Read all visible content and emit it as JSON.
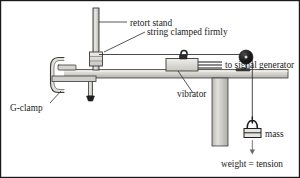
{
  "figure": {
    "border_color": "#1a1a1a",
    "background": "#ffffff"
  },
  "labels": {
    "retort_stand": "retort stand",
    "string_clamped": "string clamped firmly",
    "signal_generator": "to signal generator",
    "vibrator": "vibrator",
    "g_clamp": "G-clamp",
    "mass": "mass",
    "weight_tension": "weight = tension"
  },
  "colors": {
    "line": "#2b2b2b",
    "metal_light": "#dedcd8",
    "metal_mid": "#c3c1bc",
    "metal_dark": "#9a9894",
    "pulley": "#1c1c1c",
    "text": "#1a1a1a",
    "bench_top": "#d2d0cb",
    "bench_leg": "#bcbab5"
  },
  "parts": {
    "retort_stand": {
      "name": "retort stand rod",
      "x": 96,
      "y_top": 28,
      "y_bottom": 70
    },
    "string_clamp_block": {
      "name": "string clamp block",
      "x": 92,
      "y": 56
    },
    "vibrator": {
      "name": "vibrator box",
      "x": 168,
      "y": 62
    },
    "vibrator_peg": {
      "name": "vibrator peg",
      "x": 190,
      "y": 56
    },
    "signal_leads": {
      "name": "signal generator leads",
      "x": 207,
      "y": 64
    },
    "bench_top": {
      "name": "bench top",
      "x": 52,
      "y": 70,
      "w": 236,
      "h": 9
    },
    "bench_leg": {
      "name": "bench leg",
      "x": 212,
      "y": 79,
      "w": 16,
      "h": 67
    },
    "g_clamp": {
      "name": "G-clamp",
      "x": 56,
      "y": 58
    },
    "pulley": {
      "name": "pulley wheel",
      "cx": 246,
      "cy": 57,
      "r": 6.5
    },
    "string": {
      "name": "string",
      "from_x": 100,
      "to_x": 246,
      "y": 55
    },
    "hanging_string": {
      "name": "hanging string",
      "x": 250,
      "y_top": 60,
      "y_bottom": 118
    },
    "mass_hanger": {
      "name": "mass hanger",
      "x": 250,
      "y": 122
    },
    "weight_arrow": {
      "name": "weight arrow",
      "x": 250,
      "y_top": 136,
      "y_bottom": 152
    }
  },
  "leaders": {
    "retort_stand": {
      "from_x": 100,
      "from_y": 22,
      "to_x": 128,
      "to_y": 22
    },
    "string_clamped": {
      "from_x": 106,
      "from_y": 52,
      "to_x": 145,
      "to_y": 32
    },
    "vibrator": {
      "from_x": 178,
      "from_y": 72,
      "to_x": 194,
      "to_y": 88
    },
    "g_clamp": {
      "from_x": 62,
      "from_y": 90,
      "to_x": 50,
      "to_y": 102
    }
  }
}
